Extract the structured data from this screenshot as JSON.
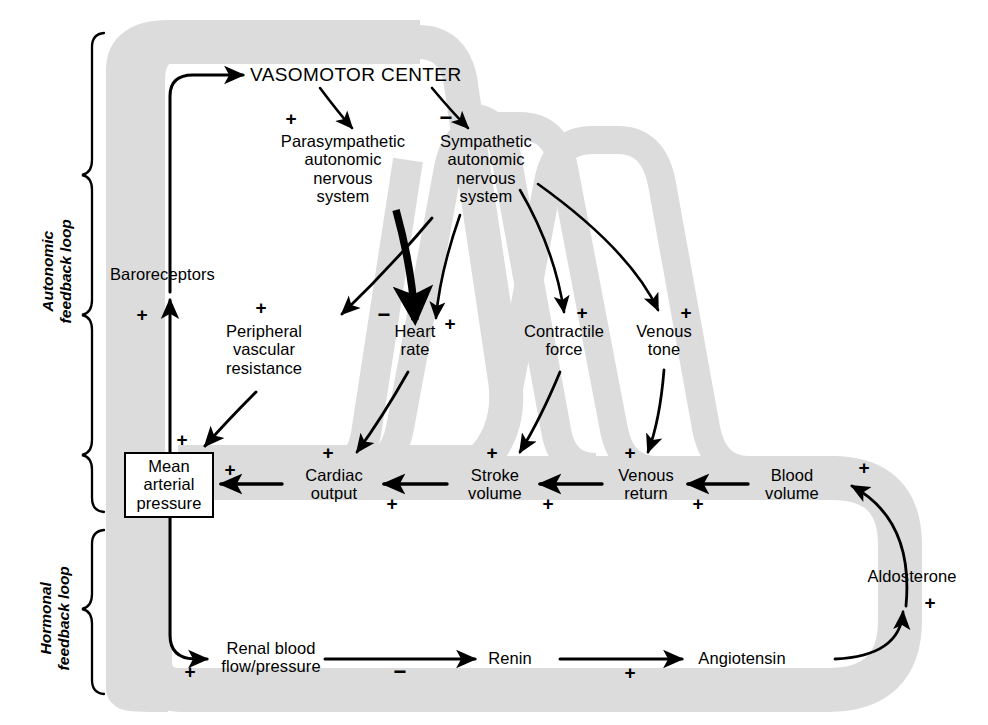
{
  "figure": {
    "type": "flow-diagram",
    "band_color": "#dcdcdc",
    "ink_color": "#000000",
    "background": "#ffffff"
  },
  "loop_labels": [
    {
      "id": "autonomic",
      "text": "Autonomic\nfeedback loop"
    },
    {
      "id": "hormonal",
      "text": "Hormonal\nfeedback loop"
    }
  ],
  "nodes": [
    {
      "id": "vasomotor_center",
      "label": "VASOMOTOR CENTER"
    },
    {
      "id": "parasympathetic",
      "label": "Parasympathetic\nautonomic\nnervous\nsystem"
    },
    {
      "id": "sympathetic",
      "label": "Sympathetic\nautonomic\nnervous\nsystem"
    },
    {
      "id": "baroreceptors",
      "label": "Baroreceptors"
    },
    {
      "id": "peripheral_vr",
      "label": "Peripheral\nvascular\nresistance"
    },
    {
      "id": "heart_rate",
      "label": "Heart\nrate"
    },
    {
      "id": "contractile_force",
      "label": "Contractile\nforce"
    },
    {
      "id": "venous_tone",
      "label": "Venous\ntone"
    },
    {
      "id": "mean_arterial_pressure",
      "label": "Mean\narterial\npressure"
    },
    {
      "id": "cardiac_output",
      "label": "Cardiac\noutput"
    },
    {
      "id": "stroke_volume",
      "label": "Stroke\nvolume"
    },
    {
      "id": "venous_return",
      "label": "Venous\nreturn"
    },
    {
      "id": "blood_volume",
      "label": "Blood\nvolume"
    },
    {
      "id": "aldosterone",
      "label": "Aldosterone"
    },
    {
      "id": "renal_blood_flow",
      "label": "Renal blood\nflow/pressure"
    },
    {
      "id": "renin",
      "label": "Renin"
    },
    {
      "id": "angiotensin",
      "label": "Angiotensin"
    }
  ],
  "edges": [
    {
      "from": "baroreceptors",
      "to": "vasomotor_center",
      "sign": ""
    },
    {
      "from": "vasomotor_center",
      "to": "parasympathetic",
      "sign": "+"
    },
    {
      "from": "vasomotor_center",
      "to": "sympathetic",
      "sign": "−"
    },
    {
      "from": "sympathetic",
      "to": "peripheral_vr",
      "sign": "+"
    },
    {
      "from": "parasympathetic",
      "to": "heart_rate",
      "sign": "−"
    },
    {
      "from": "sympathetic",
      "to": "heart_rate",
      "sign": "+"
    },
    {
      "from": "sympathetic",
      "to": "contractile_force",
      "sign": "+"
    },
    {
      "from": "sympathetic",
      "to": "venous_tone",
      "sign": "+"
    },
    {
      "from": "peripheral_vr",
      "to": "mean_arterial_pressure",
      "sign": "+"
    },
    {
      "from": "heart_rate",
      "to": "cardiac_output",
      "sign": "+"
    },
    {
      "from": "contractile_force",
      "to": "stroke_volume",
      "sign": "+"
    },
    {
      "from": "venous_tone",
      "to": "venous_return",
      "sign": "+"
    },
    {
      "from": "cardiac_output",
      "to": "mean_arterial_pressure",
      "sign": "+"
    },
    {
      "from": "stroke_volume",
      "to": "cardiac_output",
      "sign": "+"
    },
    {
      "from": "venous_return",
      "to": "stroke_volume",
      "sign": "+"
    },
    {
      "from": "blood_volume",
      "to": "venous_return",
      "sign": "+"
    },
    {
      "from": "mean_arterial_pressure",
      "to": "baroreceptors",
      "sign": "+"
    },
    {
      "from": "mean_arterial_pressure",
      "to": "renal_blood_flow",
      "sign": "+"
    },
    {
      "from": "renal_blood_flow",
      "to": "renin",
      "sign": "−"
    },
    {
      "from": "renin",
      "to": "angiotensin",
      "sign": "+"
    },
    {
      "from": "angiotensin",
      "to": "aldosterone",
      "sign": "+"
    },
    {
      "from": "aldosterone",
      "to": "blood_volume",
      "sign": "+"
    }
  ],
  "signs": {
    "vc_to_para": "+",
    "vc_to_symp": "−",
    "symp_to_pvr": "+",
    "para_to_hr": "−",
    "symp_to_hr": "+",
    "symp_to_cf": "+",
    "symp_to_vt": "+",
    "pvr_to_map": "+",
    "hr_to_co": "+",
    "cf_to_sv": "+",
    "vt_to_vr": "+",
    "co_to_map": "+",
    "sv_to_co": "+",
    "vr_to_sv": "+",
    "bv_to_vr": "+",
    "map_to_baro": "+",
    "map_to_renal": "+",
    "renal_to_renin": "−",
    "renin_to_angio": "+",
    "angio_to_aldo": "+",
    "aldo_to_bv": "+"
  }
}
